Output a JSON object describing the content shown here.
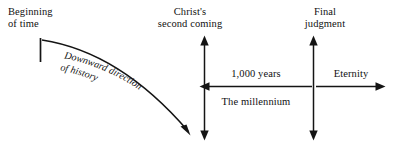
{
  "diagram": {
    "background_color": "#ffffff",
    "ink_color": "#141414",
    "labels": {
      "beginning_of_time_line1": "Beginning",
      "beginning_of_time_line2": "of time",
      "christs_second_coming_line1": "Christ's",
      "christs_second_coming_line2": "second coming",
      "final_judgment_line1": "Final",
      "final_judgment_line2": "judgment",
      "thousand_years": "1,000 years",
      "the_millennium": "The millennium",
      "eternity": "Eternity",
      "curve_line1": "Downward direction",
      "curve_line2": "of history"
    },
    "markers": {
      "beginning_tick": "vertical-tick-mark",
      "second_coming_axis": "vertical-double-arrow",
      "final_judgment_axis": "vertical-double-arrow",
      "millennium_span": "left-pointing-horizontal-arrow",
      "eternity_span": "right-pointing-horizontal-arrow",
      "history_curve": "downward-curving-arrow"
    }
  }
}
